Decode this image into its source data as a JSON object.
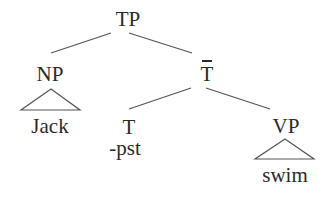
{
  "tree": {
    "root": {
      "label": "TP",
      "children": [
        {
          "label": "NP",
          "roof": true,
          "terminal": "Jack"
        },
        {
          "label": "T",
          "bar": true,
          "children": [
            {
              "label": "T",
              "feature": "-pst"
            },
            {
              "label": "VP",
              "roof": true,
              "terminal": "swim"
            }
          ]
        }
      ]
    }
  },
  "labels": {
    "tp": "TP",
    "np": "NP",
    "tbar": "T",
    "t": "T",
    "t_feature": "-pst",
    "vp": "VP",
    "np_terminal": "Jack",
    "vp_terminal": "swim"
  },
  "colors": {
    "ink": "#2a2a2a",
    "line": "#555555",
    "background": "#ffffff"
  }
}
